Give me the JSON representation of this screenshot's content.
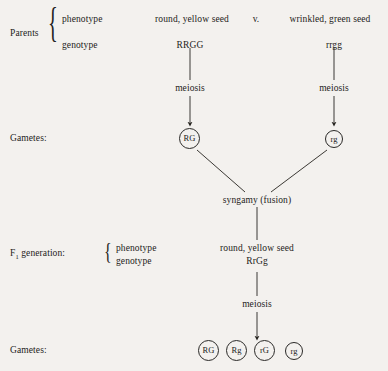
{
  "background_color": "#f3f1ee",
  "ink_color": "#1d1c1a",
  "rows": {
    "parents_label": "Parents",
    "phenotype_label": "phenotype",
    "genotype_label": "genotype",
    "gametes_label_top": "Gametes:",
    "gametes_label_bottom": "Gametes:",
    "f1_label_prefix": "F",
    "f1_label_subscript": "1",
    "f1_label_suffix": " generation:",
    "f1_phenotype_label": "phenotype",
    "f1_genotype_label": "genotype"
  },
  "parents": {
    "left_phenotype": "round, yellow seed",
    "versus": "v.",
    "right_phenotype": "wrinkled, green seed",
    "left_genotype": "RRGG",
    "right_genotype": "rrgg"
  },
  "process": {
    "meiosis_left": "meiosis",
    "meiosis_right": "meiosis",
    "syngamy": "syngamy (fusion)",
    "meiosis_f1": "meiosis"
  },
  "parent_gametes": [
    {
      "name": "gamete-RG",
      "text": "RG"
    },
    {
      "name": "gamete-rg",
      "text": "rg"
    }
  ],
  "f1": {
    "phenotype": "round, yellow seed",
    "genotype": "RrGg"
  },
  "f1_gametes": [
    {
      "name": "gamete-RG",
      "text": "RG"
    },
    {
      "name": "gamete-Rg",
      "text": "Rg"
    },
    {
      "name": "gamete-rG",
      "text": "rG"
    },
    {
      "name": "gamete-rg",
      "text": "rg"
    }
  ]
}
